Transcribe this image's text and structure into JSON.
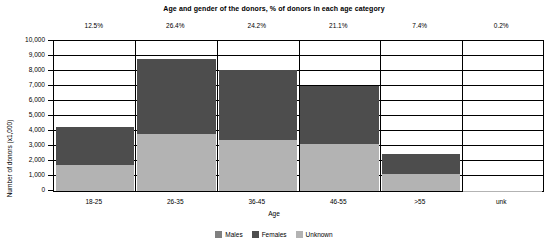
{
  "chart_data": {
    "type": "bar",
    "subtype": "stacked-bar",
    "title": "Age and gender of the donors, % of donors in each age category",
    "xlabel": "Age",
    "ylabel": "Number of donors (x1,000)",
    "categories": [
      "18-25",
      "26-35",
      "36-45",
      "46-55",
      ">55",
      "unk"
    ],
    "category_percent_labels": [
      "12.5%",
      "26.4%",
      "24.2%",
      "21.1%",
      "7.4%",
      "0.2%"
    ],
    "series": [
      {
        "name": "Unknown",
        "color": "#b3b3b3",
        "values": [
          1750,
          3800,
          3400,
          3150,
          1150,
          20
        ]
      },
      {
        "name": "Females",
        "color": "#4d4d4d",
        "values": [
          2500,
          5000,
          4700,
          3850,
          1350,
          0
        ]
      },
      {
        "name": "Males",
        "color": "#808080",
        "values": [
          0,
          0,
          0,
          0,
          0,
          0
        ]
      }
    ],
    "stack_order_bottom_to_top": [
      "Unknown",
      "Females",
      "Males"
    ],
    "totals": [
      4250,
      8800,
      8100,
      7000,
      2500,
      20
    ],
    "ylim": [
      0,
      10000
    ],
    "ytick_labels": [
      "0",
      "1,000",
      "2,000",
      "3,000",
      "4,000",
      "5,000",
      "6,000",
      "7,000",
      "8,000",
      "9,000",
      "10,000"
    ],
    "ytick_values": [
      0,
      1000,
      2000,
      3000,
      4000,
      5000,
      6000,
      7000,
      8000,
      9000,
      10000
    ],
    "grid": true,
    "legend_position": "bottom",
    "legend": [
      {
        "label": "Males",
        "color": "#808080"
      },
      {
        "label": "Females",
        "color": "#4d4d4d"
      },
      {
        "label": "Unknown",
        "color": "#b3b3b3"
      }
    ]
  }
}
